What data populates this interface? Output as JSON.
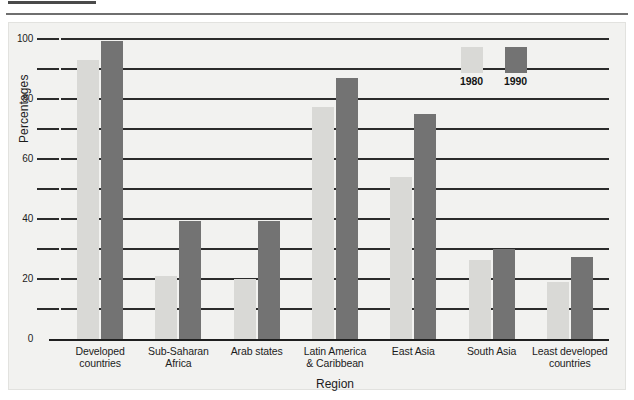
{
  "page": {
    "rule_top": "horizontal-rule-short",
    "rule_second": "horizontal-rule-long"
  },
  "chart_data": {
    "type": "bar",
    "title": "",
    "xlabel": "Region",
    "ylabel": "Percentages",
    "ylim": [
      0,
      100
    ],
    "ytick_labels": [
      "0",
      "20",
      "40",
      "60",
      "80",
      "100"
    ],
    "ytick_values": [
      0,
      20,
      40,
      60,
      80,
      100
    ],
    "gridlines": [
      10,
      20,
      30,
      40,
      50,
      60,
      70,
      80,
      90,
      100
    ],
    "grid": true,
    "legend_position": "upper-right-inside",
    "categories": [
      "Developed\ncountries",
      "Sub-Saharan\nAfrica",
      "Arab states",
      "Latin America\n& Caribbean",
      "East Asia",
      "South Asia",
      "Least developed\ncountries"
    ],
    "series": [
      {
        "name": "1980",
        "color": "#d9d9d6",
        "values": [
          93,
          21,
          20,
          77.5,
          54,
          26.5,
          19
        ]
      },
      {
        "name": "1990",
        "color": "#737373",
        "values": [
          99.5,
          39.5,
          39.5,
          87,
          75,
          30,
          27.5
        ]
      }
    ]
  },
  "legend": {
    "entries": [
      {
        "label": "1980",
        "color": "#d9d9d6"
      },
      {
        "label": "1990",
        "color": "#737373"
      }
    ]
  },
  "colors": {
    "figure_background": "#f2f2f0",
    "axis": "#1f1f1f",
    "gridline": "#2b2b2b",
    "text": "#1c1c1c",
    "series_1980": "#d9d9d6",
    "series_1990": "#737373"
  }
}
